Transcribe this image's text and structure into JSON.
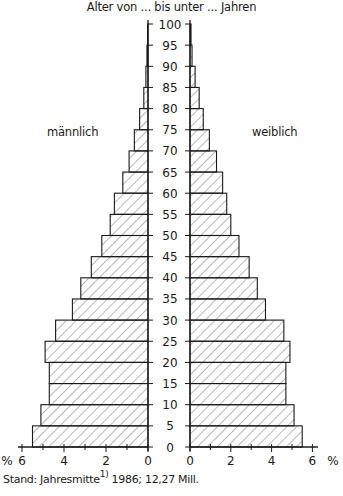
{
  "chart_data": {
    "type": "bar",
    "subtype": "population-pyramid",
    "title": "Alter von ... bis unter ... Jahren",
    "ylabel": "Alter von ... bis unter ... Jahren",
    "xlabel": "%",
    "age_ticks": [
      "0",
      "5",
      "10",
      "15",
      "20",
      "25",
      "30",
      "35",
      "40",
      "45",
      "50",
      "55",
      "60",
      "65",
      "70",
      "75",
      "80",
      "85",
      "90",
      "95",
      "100"
    ],
    "x_ticks_left": [
      "6",
      "4",
      "2",
      "0"
    ],
    "x_ticks_right": [
      "0",
      "2",
      "4",
      "6"
    ],
    "x_unit": "%",
    "xlim": [
      0,
      6
    ],
    "categories": [
      "0-5",
      "5-10",
      "10-15",
      "15-20",
      "20-25",
      "25-30",
      "30-35",
      "35-40",
      "40-45",
      "45-50",
      "50-55",
      "55-60",
      "60-65",
      "65-70",
      "70-75",
      "75-80",
      "80-85",
      "85-90",
      "90-95",
      "95-100"
    ],
    "series": [
      {
        "name": "männlich",
        "side": "left",
        "values": [
          5.5,
          5.1,
          4.7,
          4.7,
          4.9,
          4.4,
          3.6,
          3.2,
          2.7,
          2.2,
          1.8,
          1.6,
          1.2,
          0.9,
          0.65,
          0.4,
          0.2,
          0.1,
          0.05,
          0.02
        ]
      },
      {
        "name": "weiblich",
        "side": "right",
        "values": [
          5.5,
          5.1,
          4.7,
          4.7,
          4.9,
          4.6,
          3.7,
          3.3,
          2.9,
          2.4,
          2.0,
          1.8,
          1.6,
          1.3,
          0.95,
          0.65,
          0.45,
          0.25,
          0.1,
          0.05
        ]
      }
    ],
    "grid": false,
    "legend": "inline labels (männlich left, weiblich right)",
    "fill_pattern": "diagonal hatching"
  },
  "labels": {
    "title": "Alter von ... bis unter ... Jahren",
    "male": "männlich",
    "female": "weiblich",
    "percent_left": "%",
    "percent_right": "%",
    "footer_prefix": "Stand: Jahresmitte",
    "footer_note": "1)",
    "footer_suffix": " 1986; 12,27 Mill."
  },
  "colors": {
    "line": "#1a1a1a",
    "background": "#ffffff"
  }
}
